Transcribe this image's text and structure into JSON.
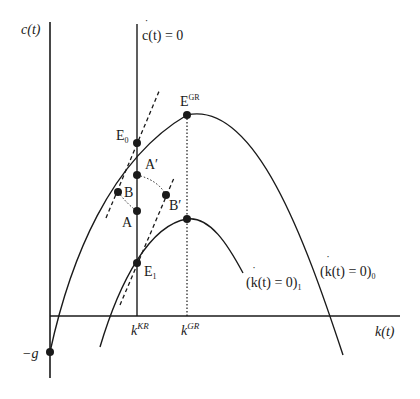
{
  "axes": {
    "y_label": "c(t)",
    "x_label": "k(t)",
    "y_intercept_label": "−g"
  },
  "lines": {
    "c_dot_zero": {
      "label_c": "c",
      "label_rest": "(t) = 0"
    },
    "k_dot_zero_0": {
      "label": "(k(t) = 0)",
      "subscript": "0"
    },
    "k_dot_zero_1": {
      "label": "(k(t) = 0)",
      "subscript": "1"
    }
  },
  "ticks": {
    "k_kr": {
      "base": "k",
      "sup": "KR"
    },
    "k_gr": {
      "base": "k",
      "sup": "GR"
    }
  },
  "points": {
    "E_GR": {
      "base": "E",
      "sup": "GR"
    },
    "E0": {
      "base": "E",
      "sub": "0"
    },
    "E1": {
      "base": "E",
      "sub": "1"
    },
    "A_prime": "A′",
    "A": "A",
    "B": "B",
    "B_prime": "B′"
  },
  "colors": {
    "ink": "#1a1a1a",
    "background": "#ffffff"
  }
}
